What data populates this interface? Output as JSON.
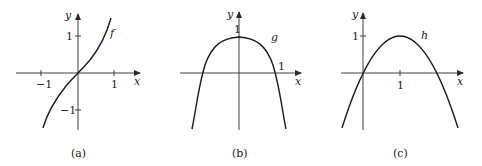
{
  "figure": {
    "panels": [
      {
        "caption": "(a)",
        "function_label": "f",
        "x_axis_label": "x",
        "y_axis_label": "y",
        "x_ticks": [
          "−1",
          "1"
        ],
        "y_ticks": [
          "1",
          "−1"
        ],
        "shape": "increasing odd cubic-like curve through origin"
      },
      {
        "caption": "(b)",
        "function_label": "g",
        "x_axis_label": "x",
        "y_axis_label": "y",
        "x_ticks": [
          "1"
        ],
        "y_ticks": [
          "1"
        ],
        "shape": "even flat-topped curve with max 1 at x=0, roots near ±1"
      },
      {
        "caption": "(c)",
        "function_label": "h",
        "x_axis_label": "x",
        "y_axis_label": "y",
        "x_ticks": [
          "1"
        ],
        "y_ticks": [
          "1"
        ],
        "shape": "downward parabola with vertex (1,1), roots at 0 and 2"
      }
    ]
  }
}
